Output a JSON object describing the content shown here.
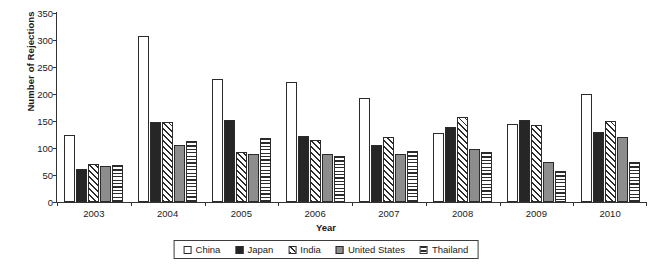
{
  "chart_data": {
    "type": "bar",
    "title": "",
    "xlabel": "Year",
    "ylabel": "Number of Rejections",
    "categories": [
      "2003",
      "2004",
      "2005",
      "2006",
      "2007",
      "2008",
      "2009",
      "2010"
    ],
    "ylim": [
      0,
      350
    ],
    "yticks": [
      0,
      50,
      100,
      150,
      200,
      250,
      300,
      350
    ],
    "grid": false,
    "legend_position": "bottom",
    "series": [
      {
        "name": "China",
        "pattern": "open-white",
        "color": "#ffffff",
        "values": [
          125,
          308,
          227,
          222,
          192,
          127,
          145,
          200
        ]
      },
      {
        "name": "Japan",
        "pattern": "solid-black",
        "color": "#262626",
        "values": [
          62,
          148,
          152,
          122,
          105,
          138,
          152,
          130
        ]
      },
      {
        "name": "India",
        "pattern": "diagonal-hatch",
        "color": "#ffffff",
        "values": [
          70,
          148,
          92,
          115,
          120,
          157,
          142,
          150
        ]
      },
      {
        "name": "United States",
        "pattern": "solid-gray",
        "color": "#8d8d8d",
        "values": [
          66,
          106,
          88,
          88,
          88,
          98,
          75,
          120
        ]
      },
      {
        "name": "Thailand",
        "pattern": "horizontal-lines",
        "color": "#ffffff",
        "values": [
          68,
          113,
          118,
          85,
          95,
          93,
          57,
          75
        ]
      }
    ]
  }
}
